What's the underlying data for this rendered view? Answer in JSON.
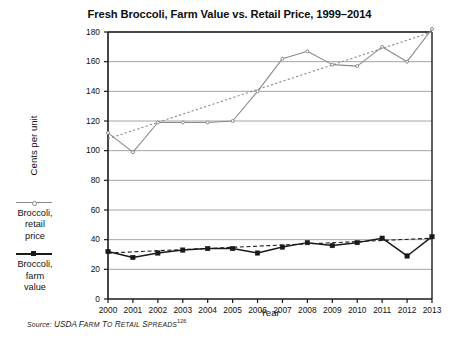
{
  "title": "Fresh Broccoli, Farm Value vs. Retail Price, 1999–2014",
  "axes": {
    "ylabel": "Cents per unit",
    "xlabel": "Year"
  },
  "legend": {
    "entries": [
      {
        "name": "retail",
        "label": "Broccoli,\nretail\nprice",
        "color": "#8a8a8a",
        "marker": "dot"
      },
      {
        "name": "farm",
        "label": "Broccoli,\nfarm\nvalue",
        "color": "#1a1a1a",
        "marker": "square"
      }
    ]
  },
  "source": {
    "prefix": "Source:",
    "text": "USDA Farm to Retail Spreads",
    "footnote": "126"
  },
  "chart_data": {
    "type": "line",
    "title": "Fresh Broccoli, Farm Value vs. Retail Price, 1999–2014",
    "xlabel": "Year",
    "ylabel": "Cents per unit",
    "x": [
      2000,
      2001,
      2002,
      2003,
      2004,
      2005,
      2006,
      2007,
      2008,
      2009,
      2010,
      2011,
      2012,
      2013
    ],
    "xlim": [
      2000,
      2013
    ],
    "ylim": [
      0,
      180
    ],
    "yticks": [
      0,
      20,
      40,
      60,
      80,
      100,
      120,
      140,
      160,
      180
    ],
    "xticks": [
      2000,
      2001,
      2002,
      2003,
      2004,
      2005,
      2006,
      2007,
      2008,
      2009,
      2010,
      2011,
      2012,
      2013
    ],
    "grid": "horizontal",
    "legend_position": "left-outside",
    "series": [
      {
        "name": "Broccoli, retail price",
        "color": "#8a8a8a",
        "values": [
          112,
          99,
          119,
          119,
          119,
          120,
          140,
          162,
          167,
          158,
          157,
          170,
          160,
          182
        ],
        "trendline": {
          "style": "dotted",
          "start": 108,
          "end": 180
        }
      },
      {
        "name": "Broccoli, farm value",
        "color": "#1a1a1a",
        "values": [
          32,
          28,
          31,
          33,
          34,
          34,
          31,
          35,
          38,
          36,
          38,
          41,
          29,
          42
        ],
        "trendline": {
          "style": "dashed",
          "start": 31,
          "end": 41
        }
      }
    ]
  },
  "geometry": {
    "plot_left": 108,
    "plot_right": 432,
    "plot_top": 32,
    "plot_bottom": 299
  }
}
